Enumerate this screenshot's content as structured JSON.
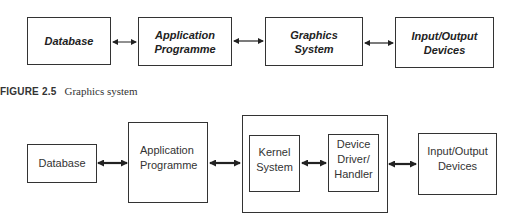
{
  "figure_top": {
    "boxes": [
      {
        "id": "database",
        "label": "Database"
      },
      {
        "id": "application-programme",
        "label": "Application\nProgramme"
      },
      {
        "id": "graphics-system",
        "label": "Graphics\nSystem"
      },
      {
        "id": "io-devices",
        "label": "Input/Output\nDevices"
      }
    ],
    "connections": [
      {
        "from": "database",
        "to": "application-programme",
        "type": "bidirectional"
      },
      {
        "from": "application-programme",
        "to": "graphics-system",
        "type": "bidirectional"
      },
      {
        "from": "graphics-system",
        "to": "io-devices",
        "type": "bidirectional"
      }
    ]
  },
  "caption": {
    "label": "FIGURE 2.5",
    "text": "Graphics system"
  },
  "figure_bottom": {
    "boxes": [
      {
        "id": "database",
        "label": "Database"
      },
      {
        "id": "application-programme",
        "label": "Application\nProgramme"
      },
      {
        "id": "graphics-system-group",
        "label": "",
        "children": [
          "kernel-system",
          "device-driver-handler"
        ]
      },
      {
        "id": "kernel-system",
        "label": "Kernel\nSystem"
      },
      {
        "id": "device-driver-handler",
        "label": "Device\nDriver/\nHandler"
      },
      {
        "id": "io-devices",
        "label": "Input/Output\nDevices"
      }
    ],
    "connections": [
      {
        "from": "database",
        "to": "application-programme",
        "type": "bidirectional"
      },
      {
        "from": "application-programme",
        "to": "graphics-system-group",
        "type": "bidirectional"
      },
      {
        "from": "kernel-system",
        "to": "device-driver-handler",
        "type": "bidirectional"
      },
      {
        "from": "graphics-system-group",
        "to": "io-devices",
        "type": "bidirectional"
      }
    ]
  }
}
